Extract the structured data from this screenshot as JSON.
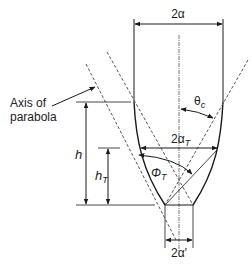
{
  "diagram": {
    "labels": {
      "entrance_width": "2α",
      "truncated_width_main": "2α",
      "truncated_width_sub": "T",
      "exit_width": "2α'",
      "acceptance_angle_main": "θ",
      "acceptance_angle_sub": "c",
      "truncation_angle_main": "Φ",
      "truncation_angle_sub": "T",
      "height": "h",
      "truncated_height_main": "h",
      "truncated_height_sub": "T",
      "axis_line1": "Axis of",
      "axis_line2": "parabola"
    },
    "colors": {
      "line": "#1a1a1a",
      "dashed": "#555555",
      "text": "#222222"
    }
  }
}
